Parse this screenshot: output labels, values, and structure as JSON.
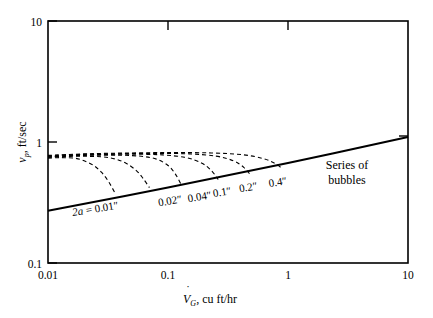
{
  "chart_data": {
    "type": "line",
    "title": "",
    "xlabel": "V̇G, cu ft/hr",
    "ylabel": "vp, ft/sec",
    "xscale": "log",
    "yscale": "log",
    "xlim": [
      0.01,
      10
    ],
    "ylim": [
      0.1,
      10
    ],
    "grid": false,
    "legend": "none",
    "xticks": [
      "0.01",
      "0.1",
      "1",
      "10"
    ],
    "xtick_values": [
      0.01,
      0.1,
      1,
      10
    ],
    "yticks": [
      "0.1",
      "1",
      "10"
    ],
    "ytick_values": [
      0.1,
      1,
      10
    ],
    "annotations": [
      {
        "text": "Series of bubbles",
        "x": 3.0,
        "y": 0.72
      },
      {
        "text": "2a = 0.01″",
        "x": 0.025,
        "y": 0.27
      }
    ],
    "series": [
      {
        "name": "Series of bubbles",
        "style": "solid",
        "x": [
          0.01,
          0.1,
          1,
          10
        ],
        "y": [
          0.27,
          0.42,
          0.67,
          1.1
        ]
      },
      {
        "name": "2a = 0.01″",
        "style": "dashed",
        "label": "2a = 0.01″",
        "label_x": 0.025,
        "label_y": 0.262,
        "x": [
          0.01,
          0.012,
          0.014,
          0.017,
          0.02,
          0.024,
          0.028,
          0.032,
          0.036
        ],
        "y": [
          0.735,
          0.742,
          0.742,
          0.733,
          0.7,
          0.64,
          0.56,
          0.47,
          0.382
        ]
      },
      {
        "name": "2a = 0.02″",
        "style": "dashed",
        "label": "0.02″",
        "label_x": 0.105,
        "label_y": 0.305,
        "x": [
          0.01,
          0.014,
          0.02,
          0.028,
          0.036,
          0.045,
          0.055,
          0.062,
          0.07
        ],
        "y": [
          0.745,
          0.76,
          0.762,
          0.755,
          0.725,
          0.665,
          0.575,
          0.5,
          0.42
        ]
      },
      {
        "name": "2a = 0.04″",
        "style": "dashed",
        "label": "0.04″",
        "label_x": 0.185,
        "label_y": 0.33,
        "x": [
          0.01,
          0.016,
          0.025,
          0.04,
          0.06,
          0.08,
          0.1,
          0.115,
          0.128
        ],
        "y": [
          0.752,
          0.77,
          0.778,
          0.778,
          0.762,
          0.722,
          0.64,
          0.545,
          0.45
        ]
      },
      {
        "name": "2a = 0.1″",
        "style": "dashed",
        "label": "0.1″",
        "label_x": 0.285,
        "label_y": 0.36,
        "x": [
          0.01,
          0.018,
          0.032,
          0.055,
          0.09,
          0.14,
          0.19,
          0.23,
          0.262
        ],
        "y": [
          0.76,
          0.78,
          0.79,
          0.792,
          0.782,
          0.745,
          0.672,
          0.58,
          0.49
        ]
      },
      {
        "name": "2a = 0.2″",
        "style": "dashed",
        "label": "0.2″",
        "label_x": 0.47,
        "label_y": 0.395,
        "x": [
          0.01,
          0.02,
          0.04,
          0.08,
          0.15,
          0.25,
          0.35,
          0.43,
          0.49
        ],
        "y": [
          0.768,
          0.79,
          0.8,
          0.805,
          0.798,
          0.765,
          0.7,
          0.615,
          0.53
        ]
      },
      {
        "name": "2a = 0.4″",
        "style": "dashed",
        "label": "0.4″",
        "label_x": 0.83,
        "label_y": 0.435,
        "x": [
          0.01,
          0.022,
          0.05,
          0.11,
          0.23,
          0.42,
          0.62,
          0.78,
          0.9
        ],
        "y": [
          0.775,
          0.8,
          0.812,
          0.818,
          0.812,
          0.785,
          0.73,
          0.665,
          0.6
        ]
      }
    ]
  },
  "axes": {
    "x_label_parts": {
      "symbol": "V",
      "dot": "˙",
      "subscript": "G",
      "rest": ", cu ft/hr"
    },
    "y_label_parts": {
      "symbol": "v",
      "subscript": "p",
      "rest": ", ft/sec"
    }
  },
  "annotation_text": {
    "series_line1": "Series of",
    "series_line2": "bubbles"
  }
}
